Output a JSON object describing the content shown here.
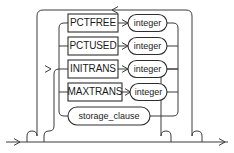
{
  "diagram": {
    "kind": "railroad-syntax-diagram",
    "name": "physical_attributes_clause",
    "line_color": "#3a3a3a",
    "box_stroke_color": "#2e2e2e",
    "text_color": "#1a1a1a",
    "background_color": "#ffffff",
    "width": 234,
    "height": 153
  },
  "rows": [
    {
      "id": "pctfree",
      "keyword": "PCTFREE",
      "argument": "integer",
      "has_argument": true,
      "y": 23
    },
    {
      "id": "pctused",
      "keyword": "PCTUSED",
      "argument": "integer",
      "has_argument": true,
      "y": 46
    },
    {
      "id": "initrans",
      "keyword": "INITRANS",
      "argument": "integer",
      "has_argument": true,
      "y": 69
    },
    {
      "id": "maxtrans",
      "keyword": "MAXTRANS",
      "argument": "integer",
      "has_argument": true,
      "y": 92
    },
    {
      "id": "storage-clause",
      "keyword": "storage_clause",
      "argument": "",
      "has_argument": false,
      "y": 116
    }
  ],
  "connectors": {
    "loopback_label": "loop-back-rail",
    "entry_label": "entry-rail",
    "exit_label": "exit-rail",
    "branch_label": "branch-spine"
  }
}
